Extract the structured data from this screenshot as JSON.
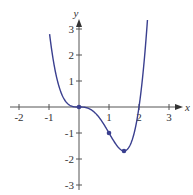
{
  "chart_data": {
    "type": "line",
    "title": "",
    "xlabel": "x",
    "ylabel": "y",
    "xlim": [
      -2.2,
      3.3
    ],
    "ylim": [
      -3.2,
      3.4
    ],
    "x_ticks": [
      "-2",
      "-1",
      "1",
      "2",
      "3"
    ],
    "y_ticks": [
      "3",
      "2",
      "1",
      "-1",
      "-2",
      "-3"
    ],
    "grid": false,
    "legend": null,
    "series": [
      {
        "name": "f(x) = x^4 - 2x^3",
        "color": "#3a3f8f",
        "x": [
          -0.98,
          -0.9,
          -0.8,
          -0.7,
          -0.6,
          -0.5,
          -0.4,
          -0.3,
          -0.2,
          -0.1,
          0,
          0.1,
          0.2,
          0.3,
          0.4,
          0.5,
          0.6,
          0.7,
          0.8,
          0.9,
          1.0,
          1.1,
          1.2,
          1.3,
          1.4,
          1.5,
          1.6,
          1.7,
          1.8,
          1.9,
          2.0,
          2.1,
          2.2,
          2.3
        ],
        "y": [
          2.8,
          2.11,
          1.43,
          0.93,
          0.56,
          0.31,
          0.15,
          0.06,
          0.02,
          0.0,
          0,
          -0.0,
          -0.01,
          -0.05,
          -0.1,
          -0.19,
          -0.3,
          -0.45,
          -0.61,
          -0.8,
          -1.0,
          -1.2,
          -1.38,
          -1.54,
          -1.65,
          -1.69,
          -1.64,
          -1.47,
          -1.17,
          -0.69,
          0,
          0.93,
          2.13,
          3.62
        ]
      }
    ],
    "marked_points": [
      {
        "x": 0,
        "y": 0
      },
      {
        "x": 1,
        "y": -1
      },
      {
        "x": 1.5,
        "y": -1.69
      }
    ]
  }
}
